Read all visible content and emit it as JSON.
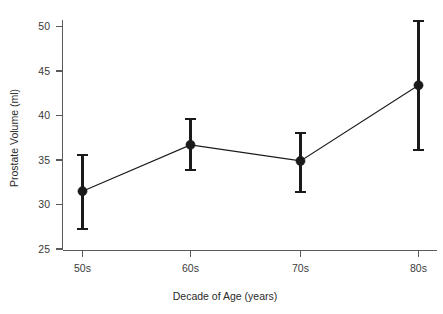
{
  "chart_data": {
    "type": "line",
    "title": "",
    "subtitle": "",
    "xlabel": "Decade of Age (years)",
    "ylabel": "Prostate Volume (ml)",
    "categories": [
      "50s",
      "60s",
      "70s",
      "80s"
    ],
    "values": [
      31.5,
      36.7,
      34.9,
      43.4
    ],
    "error_low": [
      27.2,
      33.9,
      31.4,
      36.1
    ],
    "error_high": [
      35.6,
      39.6,
      38.0,
      50.6
    ],
    "series": [
      {
        "name": "Prostate Volume",
        "values": [
          31.5,
          36.7,
          34.9,
          43.4
        ],
        "error_low": [
          27.2,
          33.9,
          31.4,
          36.1
        ],
        "error_high": [
          35.6,
          39.6,
          38.0,
          50.6
        ]
      }
    ],
    "ylim": [
      24.0,
      51.5
    ],
    "yticks": [
      25,
      30,
      35,
      40,
      45,
      50
    ],
    "ytick_labels": [
      "25",
      "30",
      "35",
      "40",
      "45",
      "50"
    ],
    "xtick_labels": [
      "50s",
      "60s",
      "70s",
      "80s"
    ],
    "grid": false,
    "legend": false,
    "legend_position": "none",
    "marker": "filled-circle",
    "errorbar_style": "capped-vertical",
    "colors": {
      "series_line": "#1a1a1a",
      "marker": "#1a1a1a",
      "errorbar": "#1a1a1a",
      "axis": "#5a5a5a",
      "tick_label": "#3a3a3a",
      "axis_title": "#2a2a2a",
      "background": "#ffffff"
    }
  },
  "axes": {
    "y_title": "Prostate Volume (ml)",
    "x_title": "Decade of Age (years)",
    "y_tick_0": "25",
    "y_tick_1": "30",
    "y_tick_2": "35",
    "y_tick_3": "40",
    "y_tick_4": "45",
    "y_tick_5": "50",
    "x_tick_0": "50s",
    "x_tick_1": "60s",
    "x_tick_2": "70s",
    "x_tick_3": "80s"
  }
}
